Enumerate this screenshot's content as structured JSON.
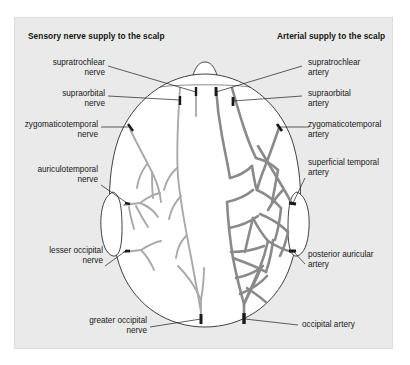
{
  "figure": {
    "kind": "anatomical-diagram",
    "view": "superior view of the head (from above)",
    "panel_background": "#eaeaea",
    "page_background": "#ffffff"
  },
  "titles": {
    "left": "Sensory nerve supply to the scalp",
    "right": "Arterial supply to the scalp"
  },
  "labels": {
    "left": [
      {
        "key": "supratrochlear-nerve",
        "line1": "supratrochlear",
        "line2": "nerve"
      },
      {
        "key": "supraorbital-nerve",
        "line1": "supraorbital",
        "line2": "nerve"
      },
      {
        "key": "zygomaticotemporal-nerve",
        "line1": "zygomaticotemporal",
        "line2": "nerve"
      },
      {
        "key": "auriculotemporal-nerve",
        "line1": "auriculotemporal",
        "line2": "nerve"
      },
      {
        "key": "lesser-occipital-nerve",
        "line1": "lesser occipital",
        "line2": "nerve"
      },
      {
        "key": "greater-occipital-nerve",
        "line1": "greater occipital",
        "line2": "nerve"
      }
    ],
    "right": [
      {
        "key": "supratrochlear-artery",
        "line1": "supratrochlear",
        "line2": "artery"
      },
      {
        "key": "supraorbital-artery",
        "line1": "supraorbital",
        "line2": "artery"
      },
      {
        "key": "zygomaticotemporal-artery",
        "line1": "zygomaticotemporal",
        "line2": "artery"
      },
      {
        "key": "superficial-temporal-artery",
        "line1": "superficial temporal",
        "line2": "artery"
      },
      {
        "key": "posterior-auricular-artery",
        "line1": "posterior auricular",
        "line2": "artery"
      },
      {
        "key": "occipital-artery",
        "line1": "occipital artery",
        "line2": ""
      }
    ]
  },
  "colors": {
    "nerve_stroke": "#a9a9a9",
    "artery_stroke": "#8a8a8a",
    "outline": "#2b2b2b",
    "leader": "#1d1d1d",
    "tick": "#1a1a1a",
    "fill": "#ffffff"
  }
}
